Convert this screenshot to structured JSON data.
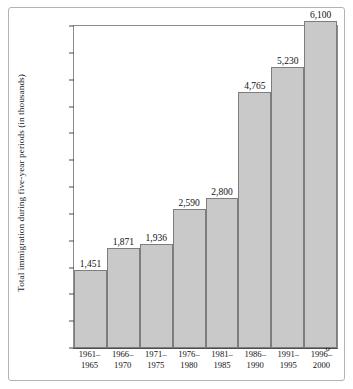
{
  "chart_data": {
    "type": "bar",
    "title": "",
    "xlabel": "",
    "ylabel": "Total immigration during five-year periods (in thousands)",
    "categories": [
      "1961–1965",
      "1966–1970",
      "1971–1975",
      "1976–1980",
      "1981–1985",
      "1986–1990",
      "1991–1995",
      "1996–2000"
    ],
    "category_lines": [
      [
        "1961–",
        "1965"
      ],
      [
        "1966–",
        "1970"
      ],
      [
        "1971–",
        "1975"
      ],
      [
        "1976–",
        "1980"
      ],
      [
        "1981–",
        "1985"
      ],
      [
        "1986–",
        "1990"
      ],
      [
        "1991–",
        "1995"
      ],
      [
        "1996–",
        "2000"
      ]
    ],
    "values": [
      1451,
      1871,
      1936,
      2590,
      2800,
      4765,
      5230,
      6100
    ],
    "value_labels": [
      "1,451",
      "1,871",
      "1,936",
      "2,590",
      "2,800",
      "4,765",
      "5,230",
      "6,100"
    ],
    "ylim": [
      0,
      6000
    ],
    "ytick_values": [
      0,
      500,
      1000,
      1500,
      2000,
      2500,
      3000,
      3500,
      4000,
      4500,
      5000,
      5500,
      6000
    ],
    "ytick_labels": [
      "0",
      "500",
      "1,000",
      "1,500",
      "2,000",
      "2,500",
      "3,000",
      "3,500",
      "4,000",
      "4,500",
      "5,000",
      "5,500",
      "6,000"
    ],
    "grid": false,
    "legend": null,
    "bar_color": "#c9c9c9",
    "bar_border_color": "#7d7d7d",
    "axis_color": "#4d4d4d",
    "text_color": "#111111",
    "background": "#ffffff"
  }
}
